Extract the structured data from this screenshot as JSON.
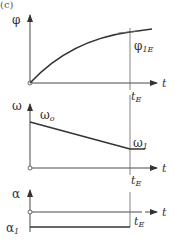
{
  "figure": {
    "panel_label": "(c)",
    "time_axis_label": "t",
    "end_time_label": "t",
    "end_time_sub": "E",
    "plots": [
      {
        "id": "phi",
        "y_label": "φ",
        "annotation": "φ",
        "annotation_sub": "1E",
        "description": "angle rises concavely from origin and levels off at φ1E at t_E"
      },
      {
        "id": "omega",
        "y_label": "ω",
        "start_label": "ω",
        "start_sub": "o",
        "end_label": "ω",
        "end_sub": "1",
        "description": "angular velocity decreases linearly from ω0 to ω1 at t_E, then constant"
      },
      {
        "id": "alpha",
        "y_label": "α",
        "value_label": "α",
        "value_sub": "1",
        "description": "constant negative angular acceleration α1 until t_E"
      }
    ]
  },
  "colors": {
    "line": "#333333",
    "axis": "#4a4a4a",
    "background": "#ffffff"
  }
}
